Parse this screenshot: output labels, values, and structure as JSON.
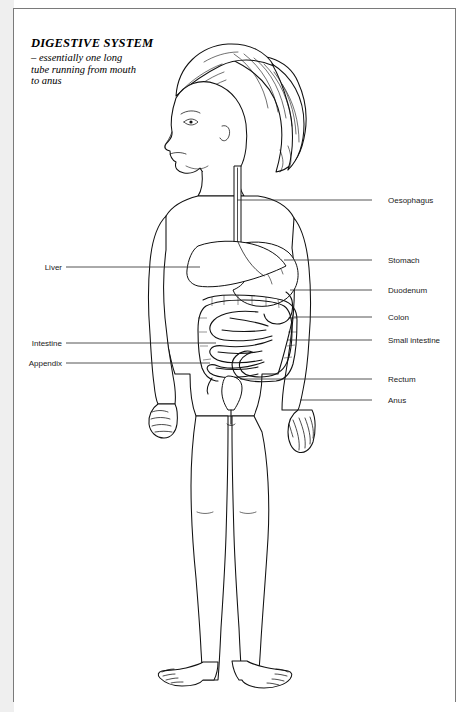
{
  "page": {
    "title": "DIGESTIVE SYSTEM",
    "subtitle_lines": [
      "– essentially one long",
      "tube running from mouth",
      "to anus"
    ],
    "background_color": "#ffffff",
    "ink_color": "#111111",
    "rule_color": "#7a7a7a"
  },
  "illustration": {
    "name": "child-figure-digestive-system",
    "description": "Line drawing of a standing child seen from the front with head turned in left profile, shoulder-length wavy hair, arms at the sides, showing the digestive tract from mouth to anus",
    "view": "anterior with head in profile"
  },
  "labels": {
    "left": [
      {
        "text": "Liver",
        "organ": "liver"
      },
      {
        "text": "Intestine",
        "organ": "intestine"
      },
      {
        "text": "Appendix",
        "organ": "appendix"
      }
    ],
    "right": [
      {
        "text": "Oesophagus",
        "organ": "oesophagus"
      },
      {
        "text": "Stomach",
        "organ": "stomach"
      },
      {
        "text": "Duodenum",
        "organ": "duodenum"
      },
      {
        "text": "Colon",
        "organ": "colon"
      },
      {
        "text": "Small intestine",
        "organ": "small-intestine"
      },
      {
        "text": "Rectum",
        "organ": "rectum"
      },
      {
        "text": "Anus",
        "organ": "anus"
      }
    ]
  }
}
